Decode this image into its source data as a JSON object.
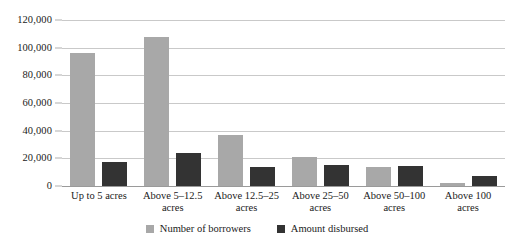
{
  "chart_data": {
    "type": "bar",
    "title": "",
    "subtitle": "",
    "xlabel": "",
    "ylabel": "",
    "ylim": [
      0,
      120000
    ],
    "ytick_step": 20000,
    "ytick_labels": [
      "0",
      "20,000",
      "40,000",
      "60,000",
      "80,000",
      "100,000",
      "120,000"
    ],
    "ytick_values": [
      0,
      20000,
      40000,
      60000,
      80000,
      100000,
      120000
    ],
    "grid": true,
    "legend_position": "bottom-center",
    "categories": [
      "Up to 5 acres",
      "Above 5–12.5 acres",
      "Above 12.5–25 acres",
      "Above 25–50 acres",
      "Above 50–100 acres",
      "Above 100 acres"
    ],
    "series": [
      {
        "name": "Number of borrowers",
        "color": "#a8a8a8",
        "values": [
          96000,
          108000,
          37000,
          21000,
          13500,
          2500
        ]
      },
      {
        "name": "Amount disbursed",
        "color": "#333333",
        "values": [
          17000,
          24000,
          14000,
          15000,
          14500,
          7500
        ]
      }
    ]
  },
  "colors": {
    "series_0": "#a8a8a8",
    "series_1": "#333333",
    "gridline": "#c9c9c9",
    "baseline": "#9a9a9a",
    "background": "#ffffff",
    "text": "#1a1a1a"
  }
}
